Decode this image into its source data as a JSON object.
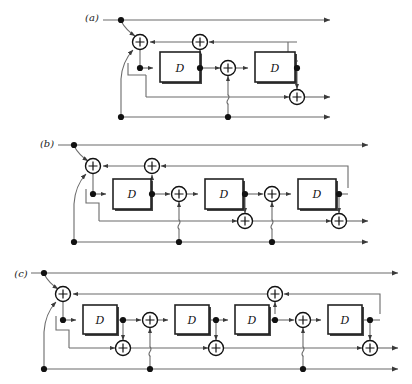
{
  "figure": {
    "background_color": "#ffffff",
    "wire_color": "#6b6b6b",
    "node_color": "#111111",
    "box_stroke_color": "#222222",
    "box_fill_color": "#ffffff",
    "label_color": "#222222"
  },
  "panels": [
    {
      "id": "a",
      "label": "(a)",
      "label_x": 92,
      "label_y": 17,
      "delay_count": 2,
      "adder_count": 4,
      "node_count": 8,
      "delays": [
        {
          "name": "delay-a-1",
          "label": "D",
          "x": 160,
          "y": 52,
          "w": 40,
          "h": 30
        },
        {
          "name": "delay-a-2",
          "label": "D",
          "x": 255,
          "y": 52,
          "w": 40,
          "h": 30
        }
      ],
      "adders": [
        {
          "name": "adder-a-1",
          "label": "+",
          "cx": 140,
          "cy": 42,
          "r": 7.5
        },
        {
          "name": "adder-a-2",
          "label": "+",
          "cx": 200,
          "cy": 42,
          "r": 7.5
        },
        {
          "name": "adder-a-3",
          "label": "+",
          "cx": 228,
          "cy": 68,
          "r": 7.5
        },
        {
          "name": "adder-a-4",
          "label": "+",
          "cx": 297,
          "cy": 97,
          "r": 7.5
        }
      ],
      "nodes": [
        {
          "name": "node-a-input-top",
          "cx": 121,
          "cy": 20
        },
        {
          "name": "node-a-tap-1",
          "cx": 140,
          "cy": 68
        },
        {
          "name": "node-a-tap-2",
          "cx": 200,
          "cy": 68
        },
        {
          "name": "node-a-tap-3",
          "cx": 297,
          "cy": 68
        },
        {
          "name": "node-a-input-bottom",
          "cx": 121,
          "cy": 117
        },
        {
          "name": "node-a-bottom-tap",
          "cx": 228,
          "cy": 117
        }
      ],
      "lines": {
        "top_rail_y": 20,
        "feedback_rail_y": 42,
        "main_rail_y": 68,
        "lower_rail_y": 97,
        "bottom_rail_y": 117,
        "left_x": 121,
        "right_x": 330
      }
    },
    {
      "id": "b",
      "label": "(b)",
      "label_x": 47,
      "label_y": 143,
      "delay_count": 3,
      "adder_count": 6,
      "node_count": 9,
      "delays": [
        {
          "name": "delay-b-1",
          "label": "D",
          "x": 113,
          "y": 179,
          "w": 38,
          "h": 30
        },
        {
          "name": "delay-b-2",
          "label": "D",
          "x": 205,
          "y": 179,
          "w": 38,
          "h": 30
        },
        {
          "name": "delay-b-3",
          "label": "D",
          "x": 298,
          "y": 179,
          "w": 38,
          "h": 30
        }
      ],
      "adders": [
        {
          "name": "adder-b-1",
          "label": "+",
          "cx": 93,
          "cy": 166,
          "r": 7.5
        },
        {
          "name": "adder-b-2",
          "label": "+",
          "cx": 152,
          "cy": 166,
          "r": 7.5
        },
        {
          "name": "adder-b-3",
          "label": "+",
          "cx": 179,
          "cy": 194,
          "r": 7.5
        },
        {
          "name": "adder-b-4",
          "label": "+",
          "cx": 272,
          "cy": 194,
          "r": 7.5
        },
        {
          "name": "adder-b-5",
          "label": "+",
          "cx": 245,
          "cy": 221,
          "r": 7.5
        },
        {
          "name": "adder-b-6",
          "label": "+",
          "cx": 339,
          "cy": 221,
          "r": 7.5
        }
      ],
      "nodes": [
        {
          "name": "node-b-input-top",
          "cx": 74,
          "cy": 145
        },
        {
          "name": "node-b-tap-1",
          "cx": 93,
          "cy": 194
        },
        {
          "name": "node-b-tap-2",
          "cx": 152,
          "cy": 194
        },
        {
          "name": "node-b-tap-3",
          "cx": 245,
          "cy": 194
        },
        {
          "name": "node-b-tap-4",
          "cx": 339,
          "cy": 194
        },
        {
          "name": "node-b-input-bottom",
          "cx": 74,
          "cy": 242
        },
        {
          "name": "node-b-bottom-tap-1",
          "cx": 179,
          "cy": 242
        },
        {
          "name": "node-b-bottom-tap-2",
          "cx": 272,
          "cy": 242
        }
      ],
      "lines": {
        "top_rail_y": 145,
        "feedback_rail_y": 166,
        "main_rail_y": 194,
        "lower_rail_y": 221,
        "bottom_rail_y": 242,
        "left_x": 74,
        "right_x": 368
      }
    },
    {
      "id": "c",
      "label": "(c)",
      "label_x": 21,
      "label_y": 273,
      "delay_count": 4,
      "adder_count": 7,
      "node_count": 11,
      "delays": [
        {
          "name": "delay-c-1",
          "label": "D",
          "x": 83,
          "y": 305,
          "w": 34,
          "h": 29
        },
        {
          "name": "delay-c-2",
          "label": "D",
          "x": 175,
          "y": 305,
          "w": 34,
          "h": 29
        },
        {
          "name": "delay-c-3",
          "label": "D",
          "x": 235,
          "y": 305,
          "w": 34,
          "h": 29
        },
        {
          "name": "delay-c-4",
          "label": "D",
          "x": 328,
          "y": 305,
          "w": 34,
          "h": 29
        }
      ],
      "adders": [
        {
          "name": "adder-c-1",
          "label": "+",
          "cx": 63,
          "cy": 294,
          "r": 7.5
        },
        {
          "name": "adder-c-2",
          "label": "+",
          "cx": 275,
          "cy": 294,
          "r": 7.5
        },
        {
          "name": "adder-c-3",
          "label": "+",
          "cx": 150,
          "cy": 320,
          "r": 7.5
        },
        {
          "name": "adder-c-4",
          "label": "+",
          "cx": 303,
          "cy": 320,
          "r": 7.5
        },
        {
          "name": "adder-c-5",
          "label": "+",
          "cx": 123,
          "cy": 348,
          "r": 7.5
        },
        {
          "name": "adder-c-6",
          "label": "+",
          "cx": 216,
          "cy": 348,
          "r": 7.5
        },
        {
          "name": "adder-c-7",
          "label": "+",
          "cx": 370,
          "cy": 348,
          "r": 7.5
        }
      ],
      "nodes": [
        {
          "name": "node-c-input-top",
          "cx": 44,
          "cy": 273
        },
        {
          "name": "node-c-tap-1",
          "cx": 63,
          "cy": 320
        },
        {
          "name": "node-c-tap-2",
          "cx": 123,
          "cy": 320
        },
        {
          "name": "node-c-tap-3",
          "cx": 216,
          "cy": 320
        },
        {
          "name": "node-c-tap-4",
          "cx": 275,
          "cy": 320
        },
        {
          "name": "node-c-tap-5",
          "cx": 370,
          "cy": 320
        },
        {
          "name": "node-c-input-bottom",
          "cx": 44,
          "cy": 369
        },
        {
          "name": "node-c-bottom-tap-1",
          "cx": 150,
          "cy": 369
        },
        {
          "name": "node-c-bottom-tap-2",
          "cx": 303,
          "cy": 369
        }
      ],
      "lines": {
        "top_rail_y": 273,
        "feedback_rail_y": 294,
        "main_rail_y": 320,
        "lower_rail_y": 348,
        "bottom_rail_y": 369,
        "left_x": 44,
        "right_x": 398
      }
    }
  ]
}
